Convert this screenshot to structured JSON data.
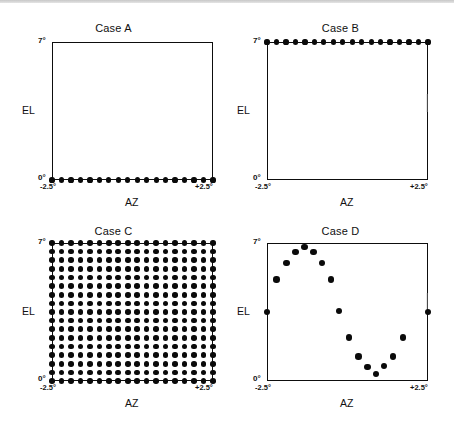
{
  "figure": {
    "background_color": "#ffffff",
    "ink_color": "#0a0a0a",
    "width": 454,
    "height": 430
  },
  "panels": [
    {
      "id": "case-a",
      "title": "Case A",
      "xlabel": "AZ",
      "ylabel": "EL",
      "x_tick_min": "-2.5°",
      "x_tick_max": "+2.5°",
      "y_tick_min": "0°",
      "y_tick_max": "7°"
    },
    {
      "id": "case-b",
      "title": "Case B",
      "xlabel": "AZ",
      "ylabel": "EL",
      "x_tick_min": "-2.5°",
      "x_tick_max": "+2.5°",
      "y_tick_min": "0°",
      "y_tick_max": "7°"
    },
    {
      "id": "case-c",
      "title": "Case C",
      "xlabel": "AZ",
      "ylabel": "EL",
      "x_tick_min": "-2.5°",
      "x_tick_max": "+2.5°",
      "y_tick_min": "0°",
      "y_tick_max": "7°"
    },
    {
      "id": "case-d",
      "title": "Case D",
      "xlabel": "AZ",
      "ylabel": "EL",
      "x_tick_min": "-2.5°",
      "x_tick_max": "+2.5°",
      "y_tick_min": "0°",
      "y_tick_max": "7°"
    }
  ],
  "chart_data": [
    {
      "type": "scatter",
      "id": "case-a",
      "title": "Case A",
      "xlabel": "AZ",
      "ylabel": "EL",
      "xlim": [
        -2.5,
        2.5
      ],
      "ylim": [
        0,
        7
      ],
      "xticks": [
        -2.5,
        2.5
      ],
      "xticklabels": [
        "-2.5°",
        "+2.5°"
      ],
      "yticks": [
        0,
        7
      ],
      "yticklabels": [
        "0°",
        "7°"
      ],
      "grid": false,
      "legend": null,
      "marker_size_px": 2.6,
      "description": "Horizontal raster scan along the bottom edge (EL = 0°), 18 sample points evenly spaced in AZ.",
      "points": [
        {
          "x": -2.5,
          "y": 0.0
        },
        {
          "x": -2.21,
          "y": 0.0
        },
        {
          "x": -1.91,
          "y": 0.0
        },
        {
          "x": -1.62,
          "y": 0.0
        },
        {
          "x": -1.32,
          "y": 0.0
        },
        {
          "x": -1.03,
          "y": 0.0
        },
        {
          "x": -0.74,
          "y": 0.0
        },
        {
          "x": -0.44,
          "y": 0.0
        },
        {
          "x": -0.15,
          "y": 0.0
        },
        {
          "x": 0.15,
          "y": 0.0
        },
        {
          "x": 0.44,
          "y": 0.0
        },
        {
          "x": 0.74,
          "y": 0.0
        },
        {
          "x": 1.03,
          "y": 0.0
        },
        {
          "x": 1.32,
          "y": 0.0
        },
        {
          "x": 1.62,
          "y": 0.0
        },
        {
          "x": 1.91,
          "y": 0.0
        },
        {
          "x": 2.21,
          "y": 0.0
        },
        {
          "x": 2.5,
          "y": 0.0
        }
      ]
    },
    {
      "type": "scatter",
      "id": "case-b",
      "title": "Case B",
      "xlabel": "AZ",
      "ylabel": "EL",
      "xlim": [
        -2.5,
        2.5
      ],
      "ylim": [
        0,
        7
      ],
      "xticks": [
        -2.5,
        2.5
      ],
      "xticklabels": [
        "-2.5°",
        "+2.5°"
      ],
      "yticks": [
        0,
        7
      ],
      "yticklabels": [
        "0°",
        "7°"
      ],
      "grid": false,
      "legend": null,
      "marker_size_px": 2.6,
      "description": "Horizontal raster scan along the top edge (EL = 7°), 18 sample points evenly spaced in AZ.",
      "points": [
        {
          "x": -2.5,
          "y": 7.0
        },
        {
          "x": -2.21,
          "y": 7.0
        },
        {
          "x": -1.91,
          "y": 7.0
        },
        {
          "x": -1.62,
          "y": 7.0
        },
        {
          "x": -1.32,
          "y": 7.0
        },
        {
          "x": -1.03,
          "y": 7.0
        },
        {
          "x": -0.74,
          "y": 7.0
        },
        {
          "x": -0.44,
          "y": 7.0
        },
        {
          "x": -0.15,
          "y": 7.0
        },
        {
          "x": 0.15,
          "y": 7.0
        },
        {
          "x": 0.44,
          "y": 7.0
        },
        {
          "x": 0.74,
          "y": 7.0
        },
        {
          "x": 1.03,
          "y": 7.0
        },
        {
          "x": 1.32,
          "y": 7.0
        },
        {
          "x": 1.62,
          "y": 7.0
        },
        {
          "x": 1.91,
          "y": 7.0
        },
        {
          "x": 2.21,
          "y": 7.0
        },
        {
          "x": 2.5,
          "y": 7.0
        }
      ],
      "annotation_note": "A very faint vertical smudge artifact is present near the right frame edge at mid height."
    },
    {
      "type": "scatter",
      "id": "case-c",
      "title": "Case C",
      "xlabel": "AZ",
      "ylabel": "EL",
      "xlim": [
        -2.5,
        2.5
      ],
      "ylim": [
        0,
        7
      ],
      "xticks": [
        -2.5,
        2.5
      ],
      "xticklabels": [
        "-2.5°",
        "+2.5°"
      ],
      "yticks": [
        0,
        7
      ],
      "yticklabels": [
        "0°",
        "7°"
      ],
      "grid": false,
      "legend": null,
      "marker_size_px": 2.8,
      "description": "Full rectangular raster: an 18 column by 17 row grid of sample points filling the whole AZ/EL field.",
      "grid_layout": {
        "columns": 18,
        "rows": 17,
        "x_start": -2.5,
        "x_end": 2.5,
        "y_start": 0,
        "y_end": 7
      },
      "point_count": 306
    },
    {
      "type": "scatter",
      "id": "case-d",
      "title": "Case D",
      "xlabel": "AZ",
      "ylabel": "EL",
      "xlim": [
        -2.5,
        2.5
      ],
      "ylim": [
        0,
        7
      ],
      "xticks": [
        -2.5,
        2.5
      ],
      "xticklabels": [
        "-2.5°",
        "+2.5°"
      ],
      "yticks": [
        0,
        7
      ],
      "yticklabels": [
        "0°",
        "7°"
      ],
      "grid": false,
      "legend": null,
      "marker_size_px": 3.2,
      "description": "Sinusoidal scan path: points rise from mid elevation at the left edge to a crest near AZ = -1.3°, fall to a trough near AZ = +1.1°, then rise again toward the right edge.",
      "points": [
        {
          "x": -2.5,
          "y": 3.5
        },
        {
          "x": -2.2,
          "y": 5.15
        },
        {
          "x": -1.9,
          "y": 6.0
        },
        {
          "x": -1.62,
          "y": 6.55
        },
        {
          "x": -1.34,
          "y": 6.8
        },
        {
          "x": -1.06,
          "y": 6.55
        },
        {
          "x": -0.8,
          "y": 6.0
        },
        {
          "x": -0.52,
          "y": 5.15
        },
        {
          "x": -0.26,
          "y": 3.55
        },
        {
          "x": 0.05,
          "y": 2.2
        },
        {
          "x": 0.34,
          "y": 1.25
        },
        {
          "x": 0.62,
          "y": 0.7
        },
        {
          "x": 0.88,
          "y": 0.35
        },
        {
          "x": 1.14,
          "y": 0.75
        },
        {
          "x": 1.42,
          "y": 1.25
        },
        {
          "x": 1.72,
          "y": 2.2
        },
        {
          "x": 2.5,
          "y": 3.5
        }
      ],
      "annotation_note": "A very faint vertical smudge artifact is present near the right frame edge at mid height."
    }
  ]
}
